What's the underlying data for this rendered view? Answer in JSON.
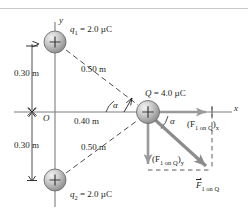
{
  "figure": {
    "kind": "physics-force-diagram",
    "colors": {
      "ink": "#231f20",
      "sphere_fill": "#b8b8b8",
      "sphere_highlight": "#ececec",
      "vector_gray": "#8c8c8c",
      "rule_gray": "#c9c9c9",
      "background": "#ffffff"
    }
  },
  "axes": {
    "x_label": "x",
    "y_label": "y",
    "origin_label": "O"
  },
  "charges": [
    {
      "id": "q1",
      "label_name": "q",
      "label_sub": "1",
      "label_value": "= 2.0 µC",
      "full_label": "q₁ = 2.0 µC",
      "sign": "+",
      "cx": 55,
      "cy": 42
    },
    {
      "id": "q2",
      "label_name": "q",
      "label_sub": "2",
      "label_value": "= 2.0 µC",
      "full_label": "q₂ = 2.0 µC",
      "sign": "+",
      "cx": 55,
      "cy": 180
    },
    {
      "id": "Q",
      "label_name": "Q",
      "label_sub": "",
      "label_value": "= 4.0 µC",
      "full_label": "Q = 4.0 µC",
      "sign": "+",
      "cx": 148,
      "cy": 112
    }
  ],
  "dimensions": [
    {
      "id": "upper-vertical",
      "text": "0.30 m"
    },
    {
      "id": "lower-vertical",
      "text": "0.30 m"
    },
    {
      "id": "horizontal",
      "text": "0.40 m"
    },
    {
      "id": "upper-diagonal",
      "text": "0.50 m"
    },
    {
      "id": "lower-diagonal",
      "text": "0.50 m"
    }
  ],
  "angles": [
    {
      "id": "alpha-left",
      "text": "α"
    },
    {
      "id": "alpha-right",
      "text": "α"
    }
  ],
  "force_labels": {
    "x_component": {
      "prefix": "(F",
      "sub": "1 on Q",
      "suffix": ")",
      "axis_sub": "x",
      "plain": "(F₁ on Q)ₓ"
    },
    "y_component": {
      "prefix": "(F",
      "sub": "1 on Q",
      "suffix": ")",
      "axis_sub": "y",
      "plain": "(F₁ on Q)ᵧ"
    },
    "resultant": {
      "symbol": "F",
      "sub": "1 on Q",
      "plain": "F⃗₁ on Q"
    }
  }
}
